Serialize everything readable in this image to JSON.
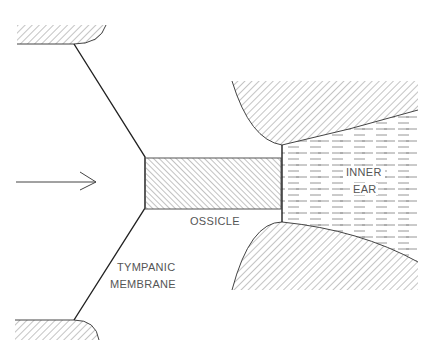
{
  "diagram": {
    "type": "ear sound-conduction schematic",
    "arrow": {
      "direction": "right",
      "meaning": "incoming sound"
    },
    "labels": {
      "ossicle": "OSSICLE",
      "inner_ear_line1": "INNER",
      "inner_ear_line2": "EAR",
      "tympanic_line1": "TYMPANIC",
      "tympanic_line2": "MEMBRANE"
    },
    "colors": {
      "background": "#ffffff",
      "line": "#222222",
      "hatch": "#888888",
      "text": "#555555"
    }
  }
}
